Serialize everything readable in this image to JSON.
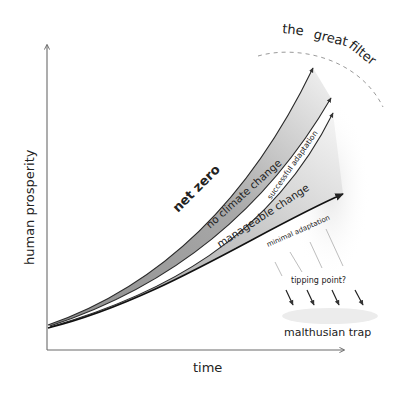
{
  "diagram": {
    "axes": {
      "x_label": "time",
      "y_label": "human prosperity"
    },
    "bands": [
      {
        "name": "net zero",
        "upper_path": "net zero",
        "lower_path": "no climate change",
        "fill": "#a9a9a9"
      },
      {
        "name": "manageable change",
        "upper_path": "successful adaptation",
        "lower_path": "minimal adaptation",
        "fill": "#c4c4c4"
      }
    ],
    "labels": {
      "net_zero": "net zero",
      "no_climate_change": "no climate change",
      "successful_adaptation": "successful adaptation",
      "manageable_change": "manageable change",
      "minimal_adaptation": "minimal adaptation",
      "tipping_point": "tipping point?",
      "malthusian_trap": "malthusian trap"
    },
    "colors": {
      "ink": "#222222",
      "axis": "#6a6a6a",
      "band_dark": "#a9a9a9",
      "band_light": "#c4c4c4",
      "dashed_arc": "#9a9a9a"
    }
  }
}
